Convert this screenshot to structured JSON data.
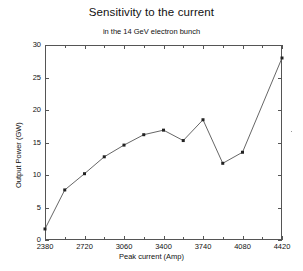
{
  "chart_data": {
    "type": "line",
    "title": "Sensitivity to the current",
    "subtitle": "in the 14 GeV electron bunch",
    "xlabel": "Peak current (Amp)",
    "ylabel": "Output Power (GW)",
    "xlim": [
      2380,
      4420
    ],
    "ylim": [
      0,
      30
    ],
    "xticks": [
      2380,
      2720,
      3060,
      3400,
      3740,
      4080,
      4420
    ],
    "yticks": [
      0,
      5,
      10,
      15,
      20,
      25,
      30
    ],
    "grid": false,
    "legend": "none",
    "marker": "square",
    "line_color": "#555555",
    "marker_color": "#222222",
    "x": [
      2380,
      2550,
      2720,
      2890,
      3060,
      3230,
      3400,
      3570,
      3740,
      3910,
      4420
    ],
    "values": [
      1.7,
      7.7,
      10.2,
      12.8,
      14.6,
      16.2,
      16.9,
      15.3,
      18.5,
      11.8,
      13.5
    ],
    "series": [
      {
        "name": "Output Power",
        "points": [
          {
            "x": 2380,
            "y": 1.7
          },
          {
            "x": 2550,
            "y": 7.7
          },
          {
            "x": 2720,
            "y": 10.2
          },
          {
            "x": 2890,
            "y": 12.8
          },
          {
            "x": 3060,
            "y": 14.6
          },
          {
            "x": 3230,
            "y": 16.2
          },
          {
            "x": 3400,
            "y": 16.9
          },
          {
            "x": 3570,
            "y": 15.3
          },
          {
            "x": 3740,
            "y": 18.5
          },
          {
            "x": 3910,
            "y": 11.8
          },
          {
            "x": 4080,
            "y": 13.5
          },
          {
            "x": 4420,
            "y": 28.0
          }
        ]
      }
    ]
  },
  "axis": {
    "y_tick_labels": [
      "30",
      "25",
      "20",
      "15",
      "10",
      "5",
      "0"
    ],
    "x_tick_labels": [
      "2380",
      "2720",
      "3060",
      "3400",
      "3740",
      "4080",
      "4420"
    ]
  }
}
